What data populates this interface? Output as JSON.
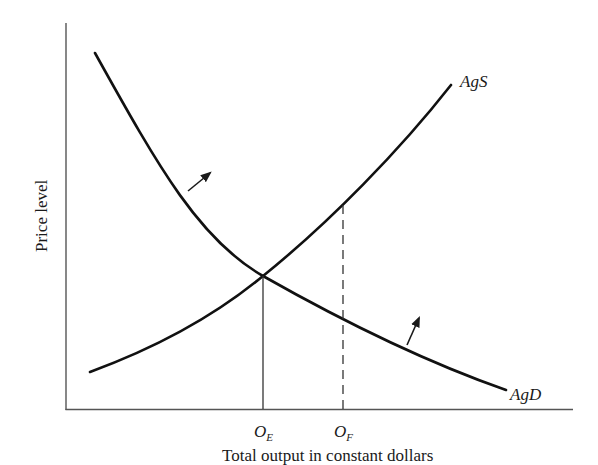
{
  "diagram": {
    "type": "supply-demand",
    "y_axis_label": "Price level",
    "x_axis_label": "Total output in constant dollars",
    "curves": [
      {
        "name": "AgS",
        "label": "AgS",
        "direction": "upward-sloping"
      },
      {
        "name": "AgD",
        "label": "AgD",
        "direction": "downward-sloping"
      }
    ],
    "markers": [
      {
        "base": "O",
        "sub": "E",
        "line": "solid",
        "meaning": "equilibrium output"
      },
      {
        "base": "O",
        "sub": "F",
        "line": "dashed",
        "meaning": "full-employment output"
      }
    ],
    "shift_arrows": [
      {
        "near": "AgD upper-left",
        "direction": "up-right"
      },
      {
        "near": "AgD lower-right",
        "direction": "up"
      }
    ]
  }
}
